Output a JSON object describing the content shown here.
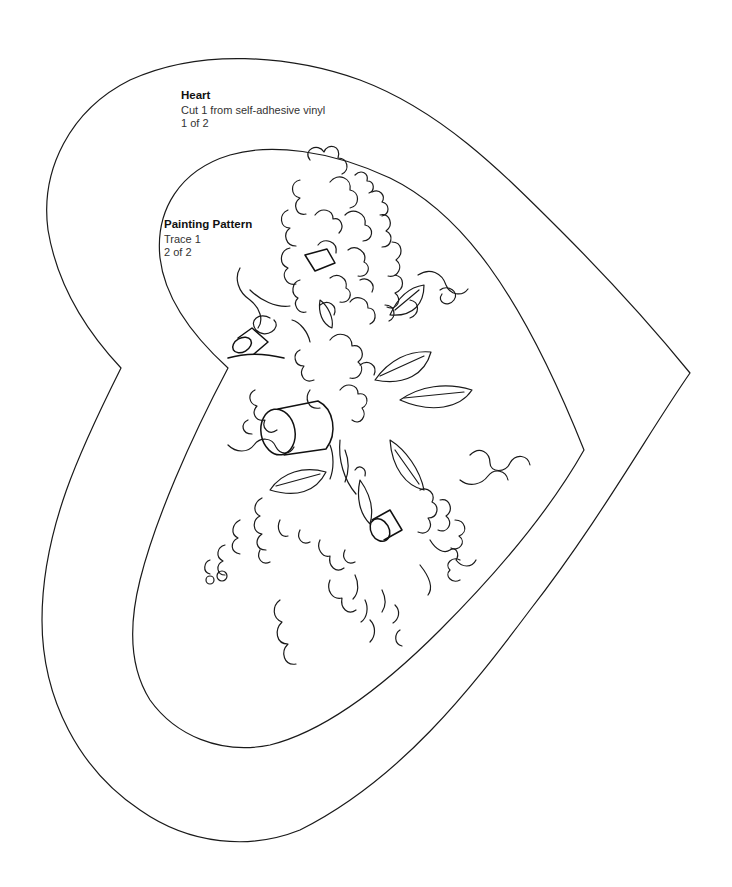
{
  "page": {
    "background": "#ffffff",
    "line_color": "#1a1a1a"
  },
  "labels": {
    "heart": {
      "title": "Heart",
      "instruction": "Cut 1 from self-adhesive vinyl",
      "page_count": "1 of 2"
    },
    "painting_pattern": {
      "title": "Painting Pattern",
      "instruction": "Trace 1",
      "page_count": "2 of 2"
    }
  },
  "shapes": {
    "outer_heart": "cut-line",
    "inner_heart": "cut-line",
    "floral_design": "lilac-bouquet-line-art"
  }
}
